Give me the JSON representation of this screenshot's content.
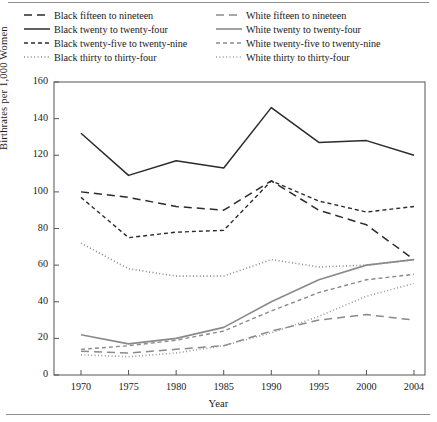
{
  "chart_data": {
    "type": "line",
    "title": "",
    "xlabel": "Year",
    "ylabel": "Birthrates per 1,000 Women",
    "x": [
      1970,
      1975,
      1980,
      1985,
      1990,
      1995,
      2000,
      2004
    ],
    "xtick_labels": [
      "1970",
      "1975",
      "1980",
      "1985",
      "1990",
      "1995",
      "2000",
      "2004"
    ],
    "ytick_labels": [
      "0",
      "20",
      "40",
      "60",
      "80",
      "100",
      "120",
      "140",
      "160"
    ],
    "ylim": [
      0,
      160
    ],
    "ytick_step": 20,
    "grid": false,
    "legend_position": "above-plot",
    "series": [
      {
        "name": "Black fifteen to nineteen",
        "legend_label": "Black fifteen to nineteen",
        "group": "Black",
        "age": "15-19",
        "color": "#2b2b2b",
        "dash": "8,5",
        "width": 1.5,
        "values": [
          100,
          97,
          92,
          90,
          106,
          90,
          82,
          63
        ]
      },
      {
        "name": "Black twenty to twenty-four",
        "legend_label": "Black twenty to twenty-four",
        "group": "Black",
        "age": "20-24",
        "color": "#2b2b2b",
        "dash": "none",
        "width": 1.5,
        "values": [
          132,
          109,
          117,
          113,
          146,
          127,
          128,
          120
        ]
      },
      {
        "name": "Black twenty-five to twenty-nine",
        "legend_label": "Black twenty-five to twenty-nine",
        "group": "Black",
        "age": "25-29",
        "color": "#2b2b2b",
        "dash": "4,3",
        "width": 1.4,
        "values": [
          97,
          75,
          78,
          79,
          106,
          95,
          89,
          92
        ]
      },
      {
        "name": "Black thirty to thirty-four",
        "legend_label": "Black thirty to thirty-four",
        "group": "Black",
        "age": "30-34",
        "color": "#8a8a8a",
        "dash": "1,2.4",
        "width": 1.6,
        "values": [
          72,
          58,
          54,
          54,
          63,
          59,
          60,
          63
        ]
      },
      {
        "name": "White fifteen to nineteen",
        "legend_label": "White fifteen to nineteen",
        "group": "White",
        "age": "15-19",
        "color": "#8a8a8a",
        "dash": "8,5",
        "width": 1.5,
        "values": [
          13,
          12,
          14,
          16,
          24,
          30,
          33,
          30
        ]
      },
      {
        "name": "White twenty to twenty-four",
        "legend_label": "White twenty to twenty-four",
        "group": "White",
        "age": "20-24",
        "color": "#8a8a8a",
        "dash": "none",
        "width": 1.6,
        "values": [
          22,
          17,
          20,
          26,
          40,
          52,
          60,
          63
        ]
      },
      {
        "name": "White twenty-five to twenty-nine",
        "legend_label": "White twenty-five to twenty-nine",
        "group": "White",
        "age": "25-29",
        "color": "#8a8a8a",
        "dash": "4,3",
        "width": 1.4,
        "values": [
          14,
          16,
          19,
          24,
          35,
          45,
          52,
          55
        ]
      },
      {
        "name": "White thirty to thirty-four",
        "legend_label": "White thirty to thirty-four",
        "group": "White",
        "age": "30-34",
        "color": "#9a9a9a",
        "dash": "1,2.4",
        "width": 1.6,
        "values": [
          11,
          10,
          12,
          16,
          23,
          32,
          43,
          50
        ]
      }
    ]
  },
  "legend": {
    "columns": [
      [
        "Black fifteen to nineteen",
        "Black twenty to twenty-four",
        "Black twenty-five to twenty-nine",
        "Black thirty to thirty-four"
      ],
      [
        "White fifteen to nineteen",
        "White twenty to twenty-four",
        "White twenty-five to twenty-nine",
        "White thirty to thirty-four"
      ]
    ]
  },
  "axes": {
    "y_title": "Birthrates per 1,000 Women",
    "x_title": "Year"
  },
  "colors": {
    "black_series": "#2b2b2b",
    "white_series": "#8a8a8a",
    "axis": "#555555",
    "rule": "#8f8f8f"
  }
}
